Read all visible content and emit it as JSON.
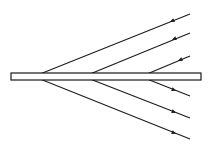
{
  "diagram": {
    "colors": {
      "stroke": "#1a1a1a",
      "background": "#ffffff"
    },
    "slab": {
      "x": 11,
      "y": 73,
      "width": 190,
      "height": 7
    },
    "upper_rays": [
      {
        "from": [
          190,
          14
        ],
        "to": [
          40,
          74
        ],
        "arrow_at": [
          172,
          21
        ],
        "direction": "incoming"
      },
      {
        "from": [
          190,
          33
        ],
        "to": [
          90,
          74
        ],
        "arrow_at": [
          174,
          39
        ],
        "direction": "incoming"
      },
      {
        "from": [
          190,
          56
        ],
        "to": [
          147,
          74
        ],
        "arrow_at": [
          180,
          60
        ],
        "direction": "incoming"
      }
    ],
    "lower_rays": [
      {
        "from": [
          147,
          79
        ],
        "to": [
          190,
          96
        ],
        "arrow_at": [
          174,
          90
        ],
        "direction": "outgoing"
      },
      {
        "from": [
          90,
          79
        ],
        "to": [
          190,
          118
        ],
        "arrow_at": [
          174,
          112
        ],
        "direction": "outgoing"
      },
      {
        "from": [
          40,
          79
        ],
        "to": [
          190,
          139
        ],
        "arrow_at": [
          174,
          133
        ],
        "direction": "outgoing"
      }
    ]
  }
}
